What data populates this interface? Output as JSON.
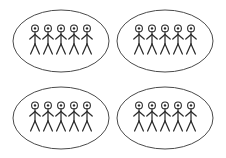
{
  "diagram": {
    "background_color": "#ffffff",
    "canvas": {
      "width": 226,
      "height": 158
    },
    "stroke_colors": {
      "ellipse": "#4a4a4a",
      "figure": "#2b2b2b",
      "head_fill": "#ffffff"
    },
    "group_count": 4,
    "figures_per_group": 5,
    "total_figures": 20,
    "groups": [
      {
        "id": "group-top-left",
        "label": "Top left group",
        "figure_count": 5,
        "ellipse": {
          "cx": 61,
          "cy": 41,
          "rx": 48,
          "ry": 31
        },
        "figures": [
          {
            "id": "figure-1",
            "x": 35,
            "y": 25
          },
          {
            "id": "figure-2",
            "x": 48,
            "y": 25
          },
          {
            "id": "figure-3",
            "x": 61,
            "y": 25
          },
          {
            "id": "figure-4",
            "x": 74,
            "y": 25
          },
          {
            "id": "figure-5",
            "x": 87,
            "y": 25
          }
        ]
      },
      {
        "id": "group-top-right",
        "label": "Top right group",
        "figure_count": 5,
        "ellipse": {
          "cx": 165,
          "cy": 41,
          "rx": 48,
          "ry": 31
        },
        "figures": [
          {
            "id": "figure-1",
            "x": 139,
            "y": 25
          },
          {
            "id": "figure-2",
            "x": 152,
            "y": 25
          },
          {
            "id": "figure-3",
            "x": 165,
            "y": 25
          },
          {
            "id": "figure-4",
            "x": 178,
            "y": 25
          },
          {
            "id": "figure-5",
            "x": 191,
            "y": 25
          }
        ]
      },
      {
        "id": "group-bottom-left",
        "label": "Bottom left group",
        "figure_count": 5,
        "ellipse": {
          "cx": 61,
          "cy": 118,
          "rx": 48,
          "ry": 31
        },
        "figures": [
          {
            "id": "figure-1",
            "x": 35,
            "y": 102
          },
          {
            "id": "figure-2",
            "x": 48,
            "y": 102
          },
          {
            "id": "figure-3",
            "x": 61,
            "y": 102
          },
          {
            "id": "figure-4",
            "x": 74,
            "y": 102
          },
          {
            "id": "figure-5",
            "x": 87,
            "y": 102
          }
        ]
      },
      {
        "id": "group-bottom-right",
        "label": "Bottom right group",
        "figure_count": 5,
        "ellipse": {
          "cx": 165,
          "cy": 118,
          "rx": 48,
          "ry": 31
        },
        "figures": [
          {
            "id": "figure-1",
            "x": 139,
            "y": 102
          },
          {
            "id": "figure-2",
            "x": 152,
            "y": 102
          },
          {
            "id": "figure-3",
            "x": 165,
            "y": 102
          },
          {
            "id": "figure-4",
            "x": 178,
            "y": 102
          },
          {
            "id": "figure-5",
            "x": 191,
            "y": 102
          }
        ]
      }
    ],
    "figure_geometry": {
      "head_radius": 3.4,
      "head_dot_radius": 1.2,
      "head_center_dy": 3.4,
      "body_top_dy": 6.8,
      "body_bottom_dy": 19,
      "arm_y_dy": 9.5,
      "arm_end_y_dy": 14,
      "arm_span": 5.2,
      "leg_end_y_dy": 29,
      "leg_span": 4.4
    }
  }
}
